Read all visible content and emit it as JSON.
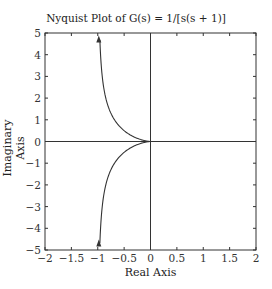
{
  "chart_data": {
    "type": "line",
    "title": "Nyquist Plot of G(s) = 1/[s(s + 1)]",
    "xlabel": "Real Axis",
    "ylabel": "Imaginary Axis",
    "xlim": [
      -2,
      2
    ],
    "ylim": [
      -5,
      5
    ],
    "xticks": [
      -2,
      -1.5,
      -1,
      -0.5,
      0,
      0.5,
      1,
      1.5,
      2
    ],
    "xtick_labels": [
      "-2",
      "-1.5",
      "-1",
      "-0.5",
      "0",
      "0.5",
      "1",
      "1.5",
      "2"
    ],
    "yticks": [
      -5,
      -4,
      -3,
      -2,
      -1,
      0,
      1,
      2,
      3,
      4,
      5
    ],
    "ytick_labels": [
      "-5",
      "-4",
      "-3",
      "-2",
      "-1",
      "0",
      "1",
      "2",
      "3",
      "4",
      "5"
    ],
    "grid": false,
    "axis_lines": {
      "real_axis_y": 0,
      "imag_axis_x": 0
    },
    "series": [
      {
        "name": "G(jw), w>0",
        "description": "Re=-1/(1+w^2), Im=-1/(w(1+w^2)); from (-1,-5) toward origin",
        "x": [
          -0.96,
          -0.9,
          -0.8,
          -0.7,
          -0.6,
          -0.5,
          -0.4,
          -0.3,
          -0.2,
          -0.1,
          0
        ],
        "y": [
          -4.7,
          -2.7,
          -1.6,
          -1.05,
          -0.73,
          -0.5,
          -0.33,
          -0.2,
          -0.1,
          -0.033,
          0
        ]
      },
      {
        "name": "G(jw), w<0",
        "description": "mirror image in upper half-plane",
        "x": [
          -0.96,
          -0.9,
          -0.8,
          -0.7,
          -0.6,
          -0.5,
          -0.4,
          -0.3,
          -0.2,
          -0.1,
          0
        ],
        "y": [
          4.7,
          2.7,
          1.6,
          1.05,
          0.73,
          0.5,
          0.33,
          0.2,
          0.1,
          0.033,
          0
        ]
      }
    ],
    "annotations": [
      {
        "type": "arrow",
        "at": [
          -1,
          4.7
        ],
        "direction": "up"
      },
      {
        "type": "arrow",
        "at": [
          -1,
          -4.7
        ],
        "direction": "up"
      }
    ]
  }
}
